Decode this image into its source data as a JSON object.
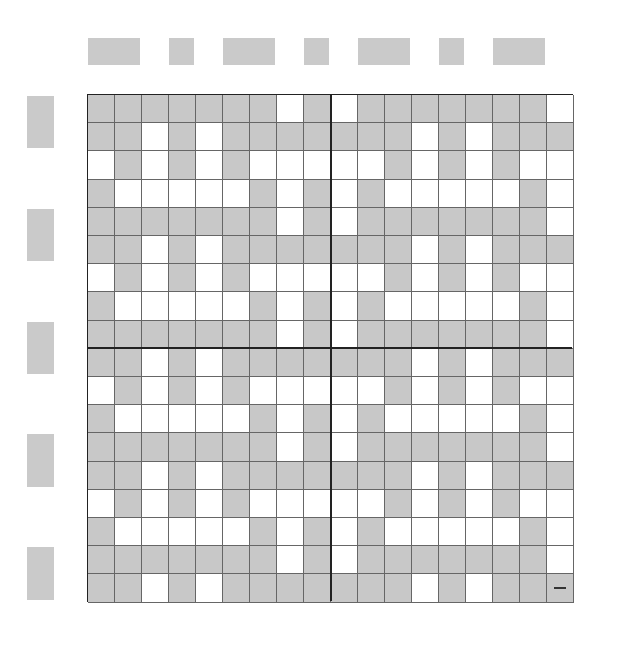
{
  "columns": [
    18,
    17,
    16,
    15,
    14,
    13,
    12,
    11,
    10,
    9,
    8,
    7,
    6,
    5,
    4,
    3,
    2,
    1
  ],
  "rows": [
    18,
    17,
    16,
    15,
    14,
    13,
    12,
    11,
    10,
    9,
    8,
    7,
    6,
    5,
    4,
    3,
    2,
    1
  ],
  "column_groups": [
    "A",
    "A",
    "B",
    "A",
    "B",
    "A",
    "A",
    "B",
    "A",
    "B",
    "A",
    "A",
    "B",
    "A",
    "B",
    "A",
    "A",
    "B"
  ],
  "row_groups": [
    "A",
    "A",
    "B",
    "B",
    "A",
    "A",
    "B",
    "B",
    "A",
    "A",
    "B",
    "B",
    "A",
    "A",
    "B",
    "B",
    "A",
    "A"
  ],
  "colors": {
    "shaded": "#c8c8c8",
    "unshaded": "#ffffff",
    "group_a_box": "#cacaca",
    "grid_line": "#222222"
  },
  "row_patterns": {
    "P": "GGGGGGGWGWGGGGGGGW",
    "Q": "GGWGWGGGGGGGWGWGGG",
    "R": "WGWGWGWWWWWGWGWGWW",
    "S": "GWWWWWGWGWGWWWWWGW"
  },
  "row_pattern_assignment": [
    "P",
    "Q",
    "R",
    "S",
    "P",
    "Q",
    "R",
    "S",
    "P",
    "Q",
    "R",
    "S",
    "P",
    "Q",
    "R",
    "S",
    "P",
    "Q"
  ],
  "marked_cell": {
    "row": 1,
    "column": 1,
    "mark": "—"
  }
}
